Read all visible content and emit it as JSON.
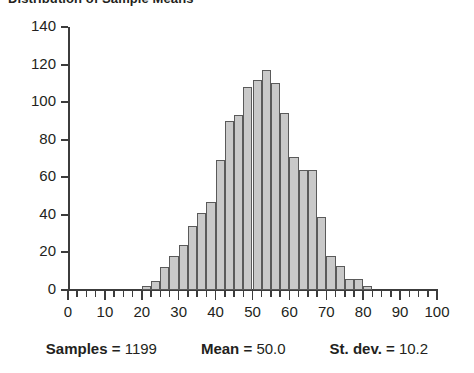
{
  "chart_data": {
    "type": "bar",
    "title": "Distribution of Sample Means",
    "xlabel": "",
    "ylabel": "",
    "xlim": [
      0,
      100
    ],
    "ylim": [
      0,
      140
    ],
    "grid": false,
    "legend": null,
    "bin_width": 2.5,
    "x_ticks": [
      0,
      10,
      20,
      30,
      40,
      50,
      60,
      70,
      80,
      90,
      100
    ],
    "y_ticks": [
      0,
      20,
      40,
      60,
      80,
      100,
      120,
      140
    ],
    "x_minor_tick_step": 2.5,
    "bar_fill": "#c9c9c9",
    "bar_edge": "#5a5a5a",
    "axis_color": "#3c3c3c",
    "bins": [
      {
        "x": 20.0,
        "value": 2
      },
      {
        "x": 22.5,
        "value": 5
      },
      {
        "x": 25.0,
        "value": 12
      },
      {
        "x": 27.5,
        "value": 18
      },
      {
        "x": 30.0,
        "value": 24
      },
      {
        "x": 32.5,
        "value": 34
      },
      {
        "x": 35.0,
        "value": 41
      },
      {
        "x": 37.5,
        "value": 47
      },
      {
        "x": 40.0,
        "value": 69
      },
      {
        "x": 42.5,
        "value": 90
      },
      {
        "x": 45.0,
        "value": 93
      },
      {
        "x": 47.5,
        "value": 108
      },
      {
        "x": 50.0,
        "value": 112
      },
      {
        "x": 52.5,
        "value": 117
      },
      {
        "x": 55.0,
        "value": 110
      },
      {
        "x": 57.5,
        "value": 94
      },
      {
        "x": 60.0,
        "value": 71
      },
      {
        "x": 62.5,
        "value": 64
      },
      {
        "x": 65.0,
        "value": 64
      },
      {
        "x": 67.5,
        "value": 39
      },
      {
        "x": 70.0,
        "value": 18
      },
      {
        "x": 72.5,
        "value": 13
      },
      {
        "x": 75.0,
        "value": 6
      },
      {
        "x": 77.5,
        "value": 6
      },
      {
        "x": 80.0,
        "value": 2
      }
    ]
  },
  "stats": {
    "samples_label": "Samples =",
    "samples_value": "1199",
    "mean_label": "Mean =",
    "mean_value": "50.0",
    "stdev_label": "St. dev. =",
    "stdev_value": "10.2"
  }
}
